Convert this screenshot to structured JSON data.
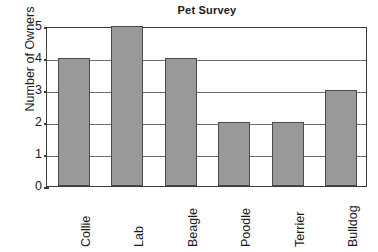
{
  "chart_data": {
    "type": "bar",
    "title": "Pet Survey",
    "xlabel": "",
    "ylabel": "Number of Owners",
    "categories": [
      "Collie",
      "Lab",
      "Beagle",
      "Poodle",
      "Terrier",
      "Bulldog"
    ],
    "values": [
      4,
      5,
      4,
      2,
      2,
      3
    ],
    "ylim": [
      0,
      5
    ],
    "yticks": [
      0,
      1,
      2,
      3,
      4,
      5
    ],
    "ytick_labels": [
      "0",
      "1",
      "2",
      "3",
      "4",
      "5"
    ],
    "grid": true,
    "legend": null,
    "colors": {
      "bar_fill": "#999999",
      "bar_edge": "#4a4a4a",
      "frame": "#3a3a3a",
      "gridline": "#6d6d6d",
      "text": "#1a1a1a",
      "background": "#ffffff"
    }
  }
}
